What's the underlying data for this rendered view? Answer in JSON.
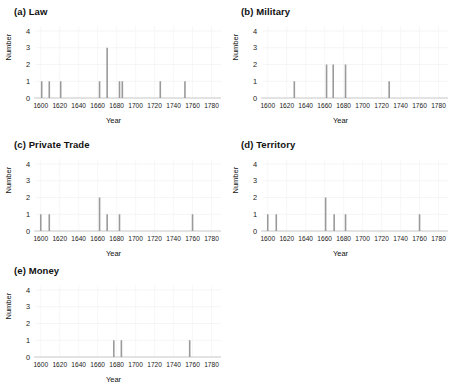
{
  "figure": {
    "background": "#ffffff",
    "bar_color": "#9a9a9a",
    "grid_color": "#f2f2f2",
    "axis_color": "#bfbfbf",
    "text_color": "#1a1a1a"
  },
  "axes": {
    "xlabel": "Year",
    "ylabel": "Number",
    "xticks": [
      1600,
      1620,
      1640,
      1660,
      1680,
      1700,
      1720,
      1740,
      1760,
      1780
    ],
    "xtick_labels": [
      "1600",
      "1620",
      "1640",
      "1660",
      "1680",
      "1700",
      "1720",
      "1740",
      "1760",
      "1780"
    ],
    "yticks": [
      0,
      1,
      2,
      3,
      4
    ],
    "ytick_labels": [
      "0",
      "1",
      "2",
      "3",
      "4"
    ],
    "xlim": [
      1595,
      1790
    ],
    "ylim": [
      0,
      4.3
    ]
  },
  "chart_data": [
    {
      "type": "bar",
      "panel": "a",
      "title": "(a) Law",
      "xlabel": "Year",
      "ylabel": "Number",
      "xlim": [
        1595,
        1790
      ],
      "ylim": [
        0,
        4.3
      ],
      "grid": true,
      "x": [
        1601,
        1609,
        1621,
        1662,
        1670,
        1683,
        1686,
        1726,
        1752
      ],
      "values": [
        1,
        1,
        1,
        1,
        3,
        1,
        1,
        1,
        1
      ]
    },
    {
      "type": "bar",
      "panel": "b",
      "title": "(b) Military",
      "xlabel": "Year",
      "ylabel": "Number",
      "xlim": [
        1595,
        1790
      ],
      "ylim": [
        0,
        4.3
      ],
      "grid": true,
      "x": [
        1628,
        1662,
        1669,
        1682,
        1728
      ],
      "values": [
        1,
        2,
        2,
        2,
        1
      ]
    },
    {
      "type": "bar",
      "panel": "c",
      "title": "(c) Private Trade",
      "xlabel": "Year",
      "ylabel": "Number",
      "xlim": [
        1595,
        1790
      ],
      "ylim": [
        0,
        4.3
      ],
      "grid": true,
      "x": [
        1600,
        1609,
        1662,
        1670,
        1683,
        1760
      ],
      "values": [
        1,
        1,
        2,
        1,
        1,
        1
      ]
    },
    {
      "type": "bar",
      "panel": "d",
      "title": "(d) Territory",
      "xlabel": "Year",
      "ylabel": "Number",
      "xlim": [
        1595,
        1790
      ],
      "ylim": [
        0,
        4.3
      ],
      "grid": true,
      "x": [
        1600,
        1609,
        1661,
        1670,
        1682,
        1760
      ],
      "values": [
        1,
        1,
        2,
        1,
        1,
        1
      ]
    },
    {
      "type": "bar",
      "panel": "e",
      "title": "(e) Money",
      "xlabel": "Year",
      "ylabel": "Number",
      "xlim": [
        1595,
        1790
      ],
      "ylim": [
        0,
        4.3
      ],
      "grid": true,
      "x": [
        1677,
        1685,
        1757
      ],
      "values": [
        1,
        1,
        1
      ]
    }
  ]
}
